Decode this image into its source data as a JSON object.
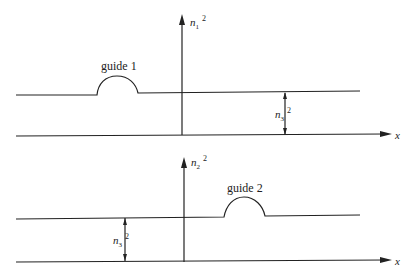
{
  "diagram": {
    "top_panel": {
      "axis_label": "n",
      "axis_subscript": "1",
      "axis_superscript": "2",
      "guide_label": "guide 1",
      "baseline_label": "n",
      "baseline_subscript": "3",
      "baseline_superscript": "2",
      "x_label": "x"
    },
    "bottom_panel": {
      "axis_label": "n",
      "axis_subscript": "2",
      "axis_superscript": "2",
      "guide_label": "guide 2",
      "baseline_label": "n",
      "baseline_subscript": "3",
      "baseline_superscript": "2",
      "x_label": "x"
    },
    "colors": {
      "line": "#222222",
      "background": "#ffffff"
    }
  }
}
